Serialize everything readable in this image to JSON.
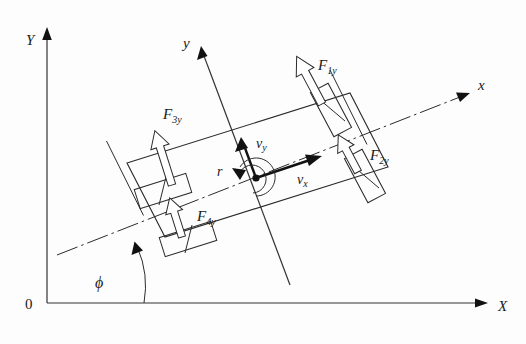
{
  "figure": {
    "background_color": "#fdfdfd",
    "ink_color": "#2b2b2b"
  },
  "global_frame": {
    "origin_label": "0",
    "y_axis_label": "Y",
    "x_axis_label": "X",
    "origin_px": [
      47,
      303
    ],
    "y_axis_tip_px": [
      47,
      30
    ],
    "x_axis_tip_px": [
      487,
      303
    ]
  },
  "body_frame": {
    "y_axis_label": "y",
    "x_axis_label": "x",
    "y_axis_tip_px": [
      202,
      48
    ],
    "x_axis_tip_px": [
      470,
      92
    ],
    "origin_px": [
      257,
      177
    ],
    "heading_angle_deg": 17.5
  },
  "angle": {
    "symbol": "ϕ",
    "name": "yaw-angle",
    "description": "angle between global X axis and body x axis",
    "value_deg": 17.5
  },
  "velocities": [
    {
      "symbol": "v",
      "subscript": "x",
      "name": "longitudinal-velocity",
      "label": "v"
    },
    {
      "symbol": "v",
      "subscript": "y",
      "name": "lateral-velocity",
      "label": "v"
    }
  ],
  "yaw_rate": {
    "symbol": "r",
    "name": "yaw-rate",
    "label": "r"
  },
  "forces": [
    {
      "id": 1,
      "symbol": "F",
      "subscript": "1y",
      "name": "tire-force-front-left",
      "wheel": "front-left",
      "label": "F"
    },
    {
      "id": 2,
      "symbol": "F",
      "subscript": "2y",
      "name": "tire-force-front-right",
      "wheel": "front-right",
      "label": "F"
    },
    {
      "id": 3,
      "symbol": "F",
      "subscript": "3y",
      "name": "tire-force-rear-left",
      "wheel": "rear-left",
      "label": "F"
    },
    {
      "id": 4,
      "symbol": "F",
      "subscript": "4y",
      "name": "tire-force-rear-right",
      "wheel": "rear-right",
      "label": "F"
    }
  ],
  "wheels": [
    {
      "id": 1,
      "name": "wheel-front-left",
      "steered": true
    },
    {
      "id": 2,
      "name": "wheel-front-right",
      "steered": true
    },
    {
      "id": 3,
      "name": "wheel-rear-left",
      "steered": false
    },
    {
      "id": 4,
      "name": "wheel-rear-right",
      "steered": false
    }
  ]
}
